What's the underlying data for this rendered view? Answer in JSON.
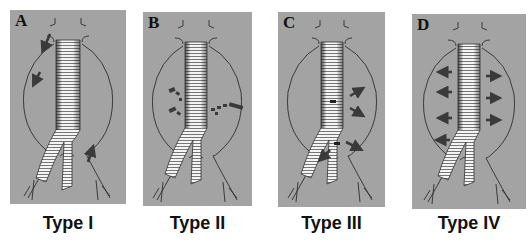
{
  "figure": {
    "colors": {
      "panel_background": "#a3a3a3",
      "outline": "#2f2f2f",
      "graft": "#f4f4f4",
      "graft_stripe": "#444444",
      "arrow": "#3a3a3a",
      "caption_text": "#111111"
    },
    "panels": [
      {
        "letter": "A",
        "caption": "Type I",
        "arrows": "proximal and distal attachment sites"
      },
      {
        "letter": "B",
        "caption": "Type II",
        "arrows": "branch vessel backflow"
      },
      {
        "letter": "C",
        "caption": "Type III",
        "arrows": "graft defect / junction"
      },
      {
        "letter": "D",
        "caption": "Type IV",
        "arrows": "graft porosity, diffuse outward"
      }
    ]
  }
}
